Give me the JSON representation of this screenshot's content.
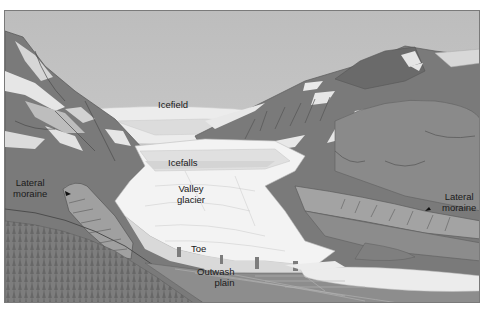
{
  "diagram": {
    "type": "labeled-illustration",
    "labels": [
      {
        "id": "icefield",
        "text": "Icefield"
      },
      {
        "id": "icefalls",
        "text": "Icefalls"
      },
      {
        "id": "valley_glacier",
        "line1": "Valley",
        "line2": "glacier"
      },
      {
        "id": "lateral_moraine_left",
        "line1": "Lateral",
        "line2": "moraine"
      },
      {
        "id": "lateral_moraine_right",
        "line1": "Lateral",
        "line2": "moraine"
      },
      {
        "id": "toe",
        "text": "Toe"
      },
      {
        "id": "outwash_plain",
        "line1": "Outwash",
        "line2": "plain"
      }
    ],
    "colors": {
      "sky": "#c6c6c6",
      "ice": "#f2f2f2",
      "ice_shadow": "#dedede",
      "rock_dark": "#6e6e6e",
      "rock_mid": "#858585",
      "slope": "#8f8f8f",
      "moraine": "#a0a0a0",
      "forest": "#7b7b7b",
      "water": "#ececec",
      "text": "#1a1a1a"
    }
  }
}
